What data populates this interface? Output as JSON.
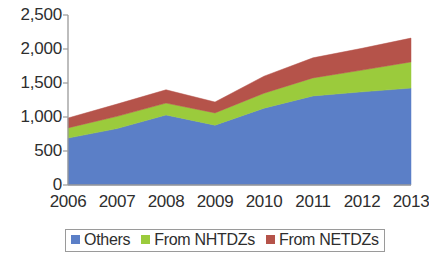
{
  "chart_data": {
    "type": "area",
    "stacked": true,
    "title": "",
    "subtitle": "",
    "xlabel": "",
    "ylabel": "",
    "categories": [
      "2006",
      "2007",
      "2008",
      "2009",
      "2010",
      "2011",
      "2012",
      "2013"
    ],
    "series": [
      {
        "name": "Others",
        "color": "#5B7FC7",
        "values": [
          690,
          830,
          1030,
          880,
          1130,
          1310,
          1370,
          1425
        ]
      },
      {
        "name": "From NHTDZs",
        "color": "#9BCB3C",
        "values": [
          150,
          180,
          175,
          180,
          220,
          265,
          320,
          385
        ]
      },
      {
        "name": "From NETDZs",
        "color": "#B5534A",
        "values": [
          145,
          180,
          195,
          160,
          250,
          295,
          320,
          350
        ]
      }
    ],
    "cumulative_totals": [
      985,
      1190,
      1400,
      1220,
      1600,
      1870,
      2010,
      2160
    ],
    "ylim": [
      0,
      2500
    ],
    "ytick_values": [
      0,
      500,
      1000,
      1500,
      2000,
      2500
    ],
    "ytick_labels": [
      "0",
      "500",
      "1,000",
      "1,500",
      "2,000",
      "2,500"
    ],
    "grid": false,
    "legend_position": "bottom"
  },
  "axis": {
    "y_line_color": "#9a9a9a",
    "x_line_color": "#9a9a9a"
  },
  "legend": {
    "items": [
      {
        "label": "Others",
        "color": "#5B7FC7"
      },
      {
        "label": "From NHTDZs",
        "color": "#9BCB3C"
      },
      {
        "label": "From NETDZs",
        "color": "#B5534A"
      }
    ]
  }
}
